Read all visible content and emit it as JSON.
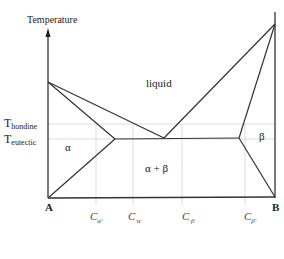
{
  "diagram": {
    "type": "binary eutectic phase diagram",
    "y_axis_label": "Temperature",
    "temperature_labels": [
      {
        "main": "T",
        "sub": "hondine"
      },
      {
        "main": "T",
        "sub": "eutectic"
      }
    ],
    "region_labels": {
      "liquid": "liquid",
      "alpha": "α",
      "beta": "β",
      "alpha_beta": "α + β"
    },
    "corner_labels": {
      "left": "A",
      "right": "B"
    },
    "composition_labels": [
      {
        "main": "C",
        "sub": "α'"
      },
      {
        "main": "C",
        "sub": "·α"
      },
      {
        "main": "C",
        "sub": "·β"
      },
      {
        "main": "C",
        "sub": "β'"
      }
    ],
    "colors": {
      "line": "#333333",
      "guide": "#cccccc",
      "text": "#222222"
    }
  }
}
